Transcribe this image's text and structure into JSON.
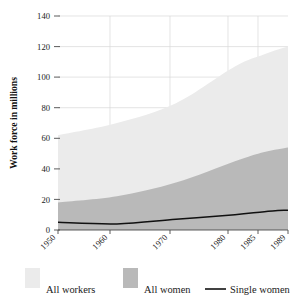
{
  "chart_data": {
    "type": "area",
    "title": "",
    "xlabel": "",
    "ylabel": "Work force in millions",
    "x": [
      1950,
      1960,
      1970,
      1980,
      1985,
      1989
    ],
    "tick_labels_x": [
      "1950",
      "1960",
      "1970",
      "1980",
      "1985",
      "1989"
    ],
    "tick_labels_y": [
      "0",
      "20",
      "40",
      "60",
      "80",
      "100",
      "120",
      "140"
    ],
    "ylim": [
      0,
      140
    ],
    "xlim": [
      1950,
      1989
    ],
    "grid": true,
    "legend_position": "bottom",
    "series": [
      {
        "name": "All workers",
        "kind": "area",
        "color": "#ebebeb",
        "values": [
          62,
          70,
          83,
          107,
          115,
          120
        ]
      },
      {
        "name": "All women",
        "kind": "area",
        "color": "#b9b9b9",
        "values": [
          18,
          22,
          31,
          45,
          51,
          54
        ]
      },
      {
        "name": "Single women",
        "kind": "line",
        "color": "#111111",
        "values": [
          5,
          4,
          7,
          10,
          12,
          13
        ]
      }
    ]
  },
  "axes": {
    "y_title": "Work force in millions",
    "y_ticks": [
      "140",
      "120",
      "100",
      "80",
      "60",
      "40",
      "20",
      "0"
    ],
    "x_ticks": [
      "1950",
      "1960",
      "1970",
      "1980",
      "1985",
      "1989"
    ]
  },
  "legend": {
    "items": [
      {
        "label": "All workers",
        "marker": "swatch",
        "color": "#ebebeb"
      },
      {
        "label": "All women",
        "marker": "swatch",
        "color": "#b9b9b9"
      },
      {
        "label": "Single women",
        "marker": "line",
        "color": "#111111"
      }
    ]
  }
}
